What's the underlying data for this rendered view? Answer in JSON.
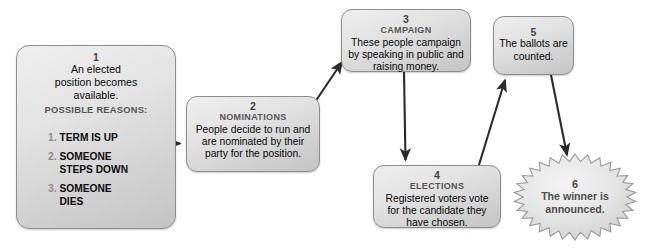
{
  "diagram": {
    "nodes": [
      {
        "id": "1",
        "number": "1",
        "subtitle": "",
        "body": "An elected\nposition becomes\navailable.",
        "reasons_heading": "POSSIBLE REASONS:",
        "reasons": [
          {
            "num": "1.",
            "text": "TERM IS UP"
          },
          {
            "num": "2.",
            "text": "SOMEONE\nSTEPS DOWN"
          },
          {
            "num": "3.",
            "text": "SOMEONE\nDIES"
          }
        ],
        "shape": "rounded-rect"
      },
      {
        "id": "2",
        "number": "2",
        "subtitle": "NOMINATIONS",
        "body": "People decide to run and are nominated by their party for the position.",
        "shape": "rounded-rect"
      },
      {
        "id": "3",
        "number": "3",
        "subtitle": "CAMPAIGN",
        "body": "These people campaign by speaking in public and raising money.",
        "shape": "rounded-rect"
      },
      {
        "id": "4",
        "number": "4",
        "subtitle": "ELECTIONS",
        "body": "Registered voters vote for the candidate they have chosen.",
        "shape": "rounded-rect"
      },
      {
        "id": "5",
        "number": "5",
        "subtitle": "",
        "body": "The ballots are counted.",
        "shape": "rounded-rect"
      },
      {
        "id": "6",
        "number": "6",
        "subtitle": "",
        "body": "The winner is announced.",
        "shape": "starburst"
      }
    ],
    "connectors": [
      {
        "from": "1",
        "to": "2",
        "direction": "right"
      },
      {
        "from": "2",
        "to": "3",
        "direction": "up-right"
      },
      {
        "from": "3",
        "to": "4",
        "direction": "down"
      },
      {
        "from": "4",
        "to": "5",
        "direction": "up-right"
      },
      {
        "from": "5",
        "to": "6",
        "direction": "down"
      }
    ],
    "colors": {
      "node_fill_light": "#efefef",
      "node_fill_dark": "#c4c4c4",
      "node_border": "#8d8d8d",
      "arrow": "#2b2b2b",
      "text": "#0d0d0d",
      "label_gray": "#555555",
      "burst_text": "#4e4e4e",
      "background": "#ffffff"
    }
  }
}
